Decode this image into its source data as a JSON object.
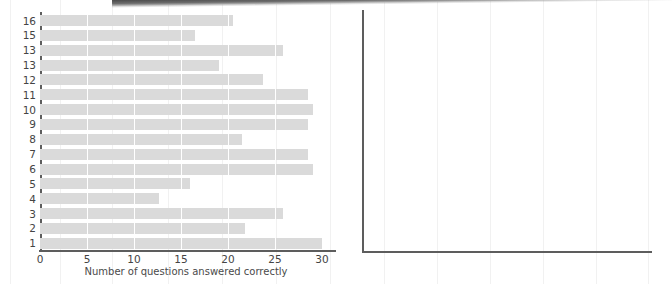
{
  "chart_data": [
    {
      "type": "bar",
      "orientation": "horizontal",
      "title": "",
      "xlabel": "Number of questions answered correctly",
      "ylabel": "Individual children",
      "xlim": [
        0,
        30
      ],
      "xticks": [
        "0",
        "5",
        "10",
        "15",
        "20",
        "25",
        "30"
      ],
      "xtick_values": [
        0,
        5,
        10,
        15,
        20,
        25,
        30
      ],
      "grid": "vertical white gridlines over bars",
      "legend": "none",
      "bar_color": "#dadada",
      "axis_color": "#5d5d5d",
      "categories": [
        "16",
        "15",
        "13",
        "13",
        "12",
        "11",
        "10",
        "9",
        "8",
        "7",
        "6",
        "5",
        "4",
        "3",
        "2",
        "1"
      ],
      "values": [
        20.5,
        16.5,
        25.8,
        19.0,
        23.7,
        28.5,
        29.0,
        28.5,
        21.5,
        28.5,
        29.0,
        16.0,
        12.7,
        25.8,
        21.8,
        30.0
      ]
    },
    {
      "type": "bar",
      "title": "",
      "xlabel": "",
      "ylabel": "",
      "categories": [],
      "values": [],
      "note": "empty axes frame, no data plotted"
    }
  ],
  "left_chart": {
    "name": "questions-answered-bar-chart",
    "y_axis_title": "Individual children",
    "x_axis_title": "Number of questions answered correctly",
    "x_ticks": [
      "0",
      "5",
      "10",
      "15",
      "20",
      "25",
      "30"
    ],
    "bars": [
      {
        "label": "16",
        "value": 20.5
      },
      {
        "label": "15",
        "value": 16.5
      },
      {
        "label": "13",
        "value": 25.8
      },
      {
        "label": "13",
        "value": 19.0
      },
      {
        "label": "12",
        "value": 23.7
      },
      {
        "label": "11",
        "value": 28.5
      },
      {
        "label": "10",
        "value": 29.0
      },
      {
        "label": "9",
        "value": 28.5
      },
      {
        "label": "8",
        "value": 21.5
      },
      {
        "label": "7",
        "value": 28.5
      },
      {
        "label": "6",
        "value": 29.0
      },
      {
        "label": "5",
        "value": 16.0
      },
      {
        "label": "4",
        "value": 12.7
      },
      {
        "label": "3",
        "value": 25.8
      },
      {
        "label": "2",
        "value": 21.8
      },
      {
        "label": "1",
        "value": 30.0
      }
    ]
  },
  "right_chart": {
    "name": "empty-plot-frame",
    "y_axis_title": "",
    "x_axis_title": "",
    "x_ticks": [],
    "bars": []
  },
  "colors": {
    "bar": "#dadada",
    "axis": "#5d5d5d",
    "gridline": "#ffffff",
    "paper_gridline": "#f1f1f1",
    "scan_band": "#3b3b3b",
    "text": "#444444"
  }
}
